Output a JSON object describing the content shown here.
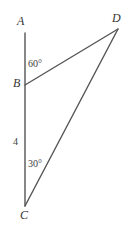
{
  "figure": {
    "background_color": "#ffffff",
    "stroke_color": "#555555",
    "label_color": "#333333",
    "width": 132,
    "height": 226
  },
  "labels": {
    "point_a": "A",
    "point_b": "B",
    "point_c": "C",
    "point_d": "D",
    "angle_at_b": "60°",
    "angle_at_c": "30°",
    "side_bc_length": "4"
  },
  "chart_data": {
    "type": "diagram",
    "points": [
      {
        "name": "A",
        "x": 25,
        "y": 33
      },
      {
        "name": "B",
        "x": 25,
        "y": 85
      },
      {
        "name": "C",
        "x": 25,
        "y": 206
      },
      {
        "name": "D",
        "x": 118,
        "y": 29
      }
    ],
    "segments": [
      {
        "from": "A",
        "to": "C",
        "note": "vertical line through B"
      },
      {
        "from": "B",
        "to": "D"
      },
      {
        "from": "C",
        "to": "D"
      }
    ],
    "angle_measures": [
      {
        "vertex": "B",
        "label": "60°",
        "value": 60,
        "between": [
          "BA",
          "BD"
        ]
      },
      {
        "vertex": "C",
        "label": "30°",
        "value": 30,
        "between": [
          "CB",
          "CD"
        ]
      }
    ],
    "length_measures": [
      {
        "segment": "BC",
        "label": "4",
        "value": 4
      }
    ]
  }
}
